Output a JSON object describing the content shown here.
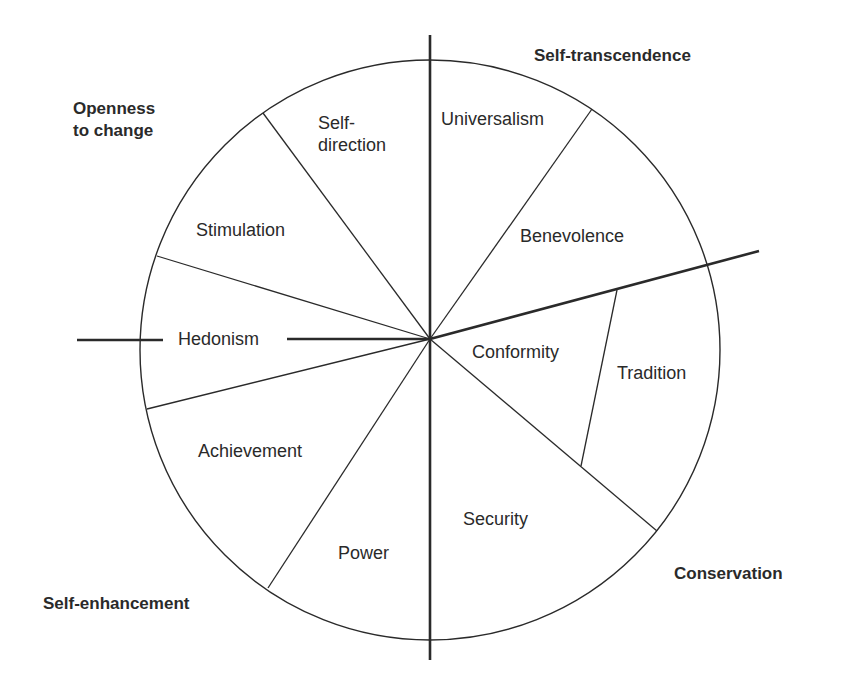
{
  "higher_order_values": {
    "openness_line1": "Openness",
    "openness_line2": "to change",
    "self_transcendence": "Self-transcendence",
    "conservation": "Conservation",
    "self_enhancement": "Self-enhancement"
  },
  "values": {
    "self_direction_line1": "Self-",
    "self_direction_line2": "direction",
    "universalism": "Universalism",
    "benevolence": "Benevolence",
    "stimulation": "Stimulation",
    "hedonism": "Hedonism",
    "conformity": "Conformity",
    "tradition": "Tradition",
    "achievement": "Achievement",
    "power": "Power",
    "security": "Security"
  },
  "colors": {
    "line": "#2a2a2a",
    "text": "#2a2a2a",
    "background": "#ffffff"
  }
}
